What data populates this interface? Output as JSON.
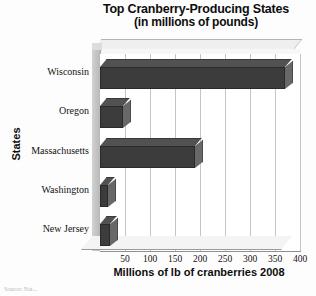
{
  "chart_data": {
    "type": "bar",
    "orientation": "horizontal",
    "title": "Top Cranberry-Producing States",
    "subtitle": "(in millions of pounds)",
    "xlabel": "Millions of lb of cranberries 2008",
    "ylabel": "States",
    "categories": [
      "Wisconsin",
      "Oregon",
      "Massachusetts",
      "Washington",
      "New Jersey"
    ],
    "values": [
      370,
      45,
      190,
      15,
      20
    ],
    "xlim": [
      0,
      400
    ],
    "xticks": [
      50,
      100,
      150,
      200,
      250,
      300,
      350,
      400
    ],
    "grid": true,
    "legend": "none",
    "style": "3d",
    "bar_color": "#3c3c3c",
    "grid_color": "#c4c4c4"
  },
  "notes": {
    "source": "Source: Nat..."
  }
}
